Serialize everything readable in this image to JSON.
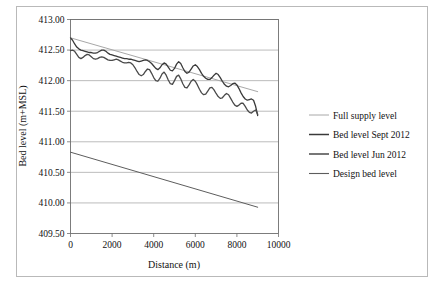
{
  "figure": {
    "background_color": "#ffffff",
    "frame_color": "#b9b9b9"
  },
  "chart_data": {
    "type": "line",
    "title": "",
    "xlabel": "Distance (m)",
    "ylabel": "Bed level (m+MSL)",
    "xlim": [
      0,
      10000
    ],
    "ylim": [
      409.5,
      413.0
    ],
    "xticks": [
      0,
      2000,
      4000,
      6000,
      8000,
      10000
    ],
    "xtick_labels": [
      "0",
      "2000",
      "4000",
      "6000",
      "8000",
      "10000"
    ],
    "yticks": [
      409.5,
      410.0,
      410.5,
      411.0,
      411.5,
      412.0,
      412.5,
      413.0
    ],
    "ytick_labels": [
      "409.50",
      "410.00",
      "410.50",
      "411.00",
      "411.50",
      "412.00",
      "412.50",
      "413.00"
    ],
    "grid": "horizontal",
    "legend_position": "right",
    "series": [
      {
        "name": "Full supply level",
        "color": "#a8a8a8",
        "width": 1.0,
        "x": [
          0,
          9000
        ],
        "y": [
          412.7,
          411.82
        ]
      },
      {
        "name": "Bed level Sept 2012",
        "color": "#3a3a3a",
        "width": 1.3,
        "x": [
          0,
          100,
          200,
          300,
          400,
          500,
          600,
          700,
          800,
          900,
          1000,
          1100,
          1200,
          1300,
          1400,
          1500,
          1600,
          1700,
          1800,
          1900,
          2000,
          2100,
          2200,
          2300,
          2400,
          2500,
          2600,
          2700,
          2800,
          2900,
          3000,
          3100,
          3200,
          3300,
          3400,
          3500,
          3600,
          3700,
          3800,
          3900,
          4000,
          4100,
          4200,
          4300,
          4400,
          4500,
          4600,
          4700,
          4800,
          4900,
          5000,
          5100,
          5200,
          5300,
          5400,
          5500,
          5600,
          5700,
          5800,
          5900,
          6000,
          6100,
          6200,
          6300,
          6400,
          6500,
          6600,
          6700,
          6800,
          6900,
          7000,
          7100,
          7200,
          7300,
          7400,
          7500,
          7600,
          7700,
          7800,
          7900,
          8000,
          8100,
          8200,
          8300,
          8400,
          8500,
          8600,
          8700,
          8800,
          8900,
          9000
        ],
        "y": [
          412.7,
          412.66,
          412.6,
          412.55,
          412.52,
          412.5,
          412.49,
          412.48,
          412.47,
          412.46,
          412.46,
          412.45,
          412.45,
          412.46,
          412.48,
          412.5,
          412.5,
          412.48,
          412.45,
          412.43,
          412.42,
          412.41,
          412.4,
          412.39,
          412.38,
          412.37,
          412.36,
          412.36,
          412.35,
          412.35,
          412.34,
          412.33,
          412.32,
          412.31,
          412.32,
          412.33,
          412.34,
          412.33,
          412.31,
          412.28,
          412.24,
          412.2,
          412.18,
          412.21,
          412.26,
          412.29,
          412.27,
          412.22,
          412.17,
          412.16,
          412.2,
          412.27,
          412.31,
          412.28,
          412.21,
          412.15,
          412.12,
          412.14,
          412.19,
          412.24,
          412.26,
          412.23,
          412.18,
          412.12,
          412.07,
          412.04,
          412.02,
          412.02,
          412.05,
          412.09,
          412.12,
          412.1,
          412.05,
          411.99,
          411.94,
          411.91,
          411.9,
          411.92,
          411.95,
          411.96,
          411.93,
          411.87,
          411.8,
          411.74,
          411.7,
          411.68,
          411.69,
          411.7,
          411.68,
          411.58,
          411.43
        ]
      },
      {
        "name": "Bed level Jun 2012",
        "color": "#4a4a4a",
        "width": 1.3,
        "x": [
          0,
          100,
          200,
          300,
          400,
          500,
          600,
          700,
          800,
          900,
          1000,
          1100,
          1200,
          1300,
          1400,
          1500,
          1600,
          1700,
          1800,
          1900,
          2000,
          2100,
          2200,
          2300,
          2400,
          2500,
          2600,
          2700,
          2800,
          2900,
          3000,
          3100,
          3200,
          3300,
          3400,
          3500,
          3600,
          3700,
          3800,
          3900,
          4000,
          4100,
          4200,
          4300,
          4400,
          4500,
          4600,
          4700,
          4800,
          4900,
          5000,
          5100,
          5200,
          5300,
          5400,
          5500,
          5600,
          5700,
          5800,
          5900,
          6000,
          6100,
          6200,
          6300,
          6400,
          6500,
          6600,
          6700,
          6800,
          6900,
          7000,
          7100,
          7200,
          7300,
          7400,
          7500,
          7600,
          7700,
          7800,
          7900,
          8000,
          8100,
          8200,
          8300,
          8400,
          8500,
          8600,
          8700,
          8800,
          8900,
          9000
        ],
        "y": [
          412.49,
          412.5,
          412.48,
          412.43,
          412.38,
          412.36,
          412.38,
          412.41,
          412.43,
          412.42,
          412.39,
          412.36,
          412.35,
          412.36,
          412.38,
          412.39,
          412.38,
          412.36,
          412.34,
          412.33,
          412.33,
          412.34,
          412.35,
          412.34,
          412.32,
          412.3,
          412.29,
          412.29,
          412.3,
          412.29,
          412.26,
          412.21,
          412.15,
          412.1,
          412.08,
          412.1,
          412.15,
          412.19,
          412.18,
          412.12,
          412.05,
          412.0,
          411.99,
          412.04,
          412.11,
          412.14,
          412.09,
          412.01,
          411.95,
          411.94,
          412.0,
          412.07,
          412.09,
          412.03,
          411.95,
          411.89,
          411.88,
          411.93,
          411.99,
          412.02,
          411.99,
          411.93,
          411.86,
          411.8,
          411.77,
          411.78,
          411.83,
          411.88,
          411.89,
          411.85,
          411.79,
          411.74,
          411.71,
          411.72,
          411.76,
          411.79,
          411.77,
          411.71,
          411.65,
          411.6,
          411.58,
          411.6,
          411.63,
          411.63,
          411.58,
          411.52,
          411.48,
          411.47,
          411.5,
          411.52,
          411.45
        ]
      },
      {
        "name": "Design bed level",
        "color": "#5d5d5d",
        "width": 1.0,
        "x": [
          0,
          9000
        ],
        "y": [
          410.83,
          409.93
        ]
      }
    ],
    "legend_entries": [
      {
        "label": "Full supply level",
        "color": "#a8a8a8",
        "width": 1.0
      },
      {
        "label": "Bed level Sept 2012",
        "color": "#3a3a3a",
        "width": 1.5
      },
      {
        "label": "Bed level Jun 2012",
        "color": "#4a4a4a",
        "width": 1.5
      },
      {
        "label": "Design bed level",
        "color": "#5d5d5d",
        "width": 1.1
      }
    ]
  }
}
